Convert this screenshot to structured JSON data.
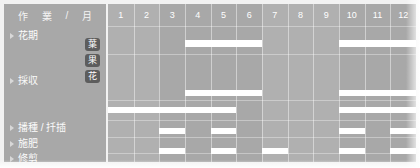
{
  "header": {
    "label_parts": [
      "作",
      "業",
      "/",
      "月"
    ],
    "months": [
      "1",
      "2",
      "3",
      "4",
      "5",
      "6",
      "7",
      "8",
      "9",
      "10",
      "11",
      "12"
    ]
  },
  "badges": [
    {
      "label": "葉"
    },
    {
      "label": "果"
    },
    {
      "label": "花"
    }
  ],
  "rows": [
    {
      "label": "花期"
    },
    {
      "label": "採収"
    },
    {
      "label": "播種 / 扦插"
    },
    {
      "label": "施肥"
    },
    {
      "label": "修剪"
    }
  ],
  "colors": {
    "page_background": "#f2f2f2",
    "label_column": "#a8a8a8",
    "grid_area": "#b0b0b0",
    "bar": "#ffffff",
    "badge": "#5d5d5d",
    "text": "#fbfbfb"
  },
  "chart_data": {
    "type": "bar",
    "xlabel": "月",
    "ylabel": "作業",
    "categories": [
      "1",
      "2",
      "3",
      "4",
      "5",
      "6",
      "7",
      "8",
      "9",
      "10",
      "11",
      "12"
    ],
    "xlim": [
      1,
      13
    ],
    "grid": true,
    "legend": null,
    "series": [
      {
        "name": "花期",
        "row": 0,
        "intervals": [
          {
            "start_month": 4,
            "end_month": 6
          },
          {
            "start_month": 10,
            "end_month": 12
          }
        ]
      },
      {
        "name": "採収 葉",
        "row": 1,
        "intervals": []
      },
      {
        "name": "採収 果",
        "row": 2,
        "intervals": []
      },
      {
        "name": "採収 花",
        "row": 3,
        "intervals": [
          {
            "start_month": 4,
            "end_month": 6
          },
          {
            "start_month": 10,
            "end_month": 12
          }
        ]
      },
      {
        "name": "播種 / 扦插",
        "row": 4,
        "intervals": [
          {
            "start_month": 1,
            "end_month": 5
          },
          {
            "start_month": 10,
            "end_month": 12
          }
        ]
      },
      {
        "name": "施肥",
        "row": 5,
        "intervals": [
          {
            "start_month": 3,
            "end_month": 3
          },
          {
            "start_month": 5,
            "end_month": 5
          },
          {
            "start_month": 10,
            "end_month": 10
          },
          {
            "start_month": 12,
            "end_month": 12
          }
        ]
      },
      {
        "name": "修剪",
        "row": 6,
        "intervals": [
          {
            "start_month": 3,
            "end_month": 3
          },
          {
            "start_month": 5,
            "end_month": 5
          },
          {
            "start_month": 7,
            "end_month": 7
          },
          {
            "start_month": 10,
            "end_month": 10
          },
          {
            "start_month": 12,
            "end_month": 12
          }
        ]
      }
    ]
  },
  "layout": {
    "row_label_tops": [
      30,
      75,
      122,
      138,
      153
    ],
    "bar_rows": [
      {
        "key": "花期",
        "top": 36,
        "height": 7
      },
      {
        "key": "採収-葉",
        "top": 55,
        "height": 6
      },
      {
        "key": "採収-果",
        "top": 70,
        "height": 6
      },
      {
        "key": "採収-花",
        "top": 86,
        "height": 6
      },
      {
        "key": "播種",
        "top": 103,
        "height": 6
      },
      {
        "key": "施肥",
        "top": 124,
        "height": 6
      },
      {
        "key": "修剪",
        "top": 144,
        "height": 6
      }
    ],
    "hline_tops": [
      22,
      50,
      96,
      116,
      133,
      149
    ],
    "shaded_months": [
      3,
      4,
      5,
      6,
      10,
      11,
      12
    ]
  }
}
